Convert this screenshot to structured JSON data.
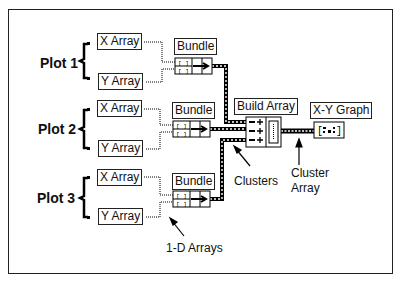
{
  "diagram": {
    "plots": [
      {
        "label": "Plot 1",
        "x_array": "X Array",
        "y_array": "Y Array",
        "bundle": "Bundle"
      },
      {
        "label": "Plot 2",
        "x_array": "X Array",
        "y_array": "Y Array",
        "bundle": "Bundle"
      },
      {
        "label": "Plot 3",
        "x_array": "X Array",
        "y_array": "Y Array",
        "bundle": "Bundle"
      }
    ],
    "build_array_label": "Build Array",
    "xy_graph_label": "X-Y Graph",
    "annotations": {
      "clusters": "Clusters",
      "cluster_array_line1": "Cluster",
      "cluster_array_line2": "Array",
      "one_d_arrays": "1-D Arrays"
    }
  }
}
